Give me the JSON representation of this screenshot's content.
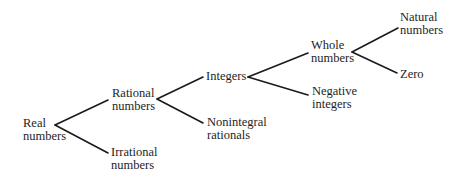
{
  "diagram": {
    "type": "tree",
    "colors": {
      "background": "#ffffff",
      "text": "#1e1e1e",
      "edge": "#1a1a1a"
    },
    "nodes": {
      "real": {
        "line1": "Real",
        "line2": "numbers"
      },
      "rational": {
        "line1": "Rational",
        "line2": "numbers"
      },
      "irrational": {
        "line1": "Irrational",
        "line2": "numbers"
      },
      "integers": {
        "line1": "Integers"
      },
      "nonintegral": {
        "line1": "Nonintegral",
        "line2": "rationals"
      },
      "whole": {
        "line1": "Whole",
        "line2": "numbers"
      },
      "negative": {
        "line1": "Negative",
        "line2": "integers"
      },
      "natural": {
        "line1": "Natural",
        "line2": "numbers"
      },
      "zero": {
        "line1": "Zero"
      }
    },
    "edges": [
      {
        "from": "Real numbers",
        "to": "Rational numbers"
      },
      {
        "from": "Real numbers",
        "to": "Irrational numbers"
      },
      {
        "from": "Rational numbers",
        "to": "Integers"
      },
      {
        "from": "Rational numbers",
        "to": "Nonintegral rationals"
      },
      {
        "from": "Integers",
        "to": "Whole numbers"
      },
      {
        "from": "Integers",
        "to": "Negative integers"
      },
      {
        "from": "Whole numbers",
        "to": "Natural numbers"
      },
      {
        "from": "Whole numbers",
        "to": "Zero"
      }
    ]
  }
}
